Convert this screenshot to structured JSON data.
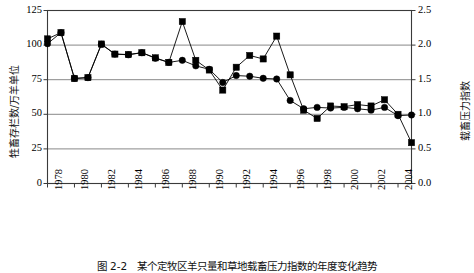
{
  "figure": {
    "caption": "图 2-2　某个定牧区羊只量和草地载畜压力指数的年度变化趋势"
  },
  "chart_data": {
    "type": "line",
    "title": "",
    "xlabel": "",
    "ylabel": "牲畜存栏数/万羊单位",
    "y2label": "载畜压力指数",
    "grid": true,
    "legend": "none",
    "xlim": [
      1978,
      2005
    ],
    "ylim": [
      0,
      125
    ],
    "y2lim": [
      0.0,
      2.5
    ],
    "ytick_labels": [
      "125",
      "100",
      "75",
      "50",
      "25",
      "0"
    ],
    "ytick_values": [
      125,
      100,
      75,
      50,
      25,
      0
    ],
    "y2tick_labels": [
      "2.5",
      "2.0",
      "1.5",
      "1.0",
      "0.5",
      "0.0"
    ],
    "y2tick_values": [
      2.5,
      2.0,
      1.5,
      1.0,
      0.5,
      0.0
    ],
    "xtick_labels": [
      "1978",
      "1980",
      "1982",
      "1984",
      "1986",
      "1988",
      "1990",
      "1992",
      "1994",
      "1996",
      "1998",
      "2000",
      "2002",
      "2004"
    ],
    "xtick_values": [
      1978,
      1980,
      1982,
      1984,
      1986,
      1988,
      1990,
      1992,
      1994,
      1996,
      1998,
      2000,
      2002,
      2004
    ],
    "x": [
      1978,
      1979,
      1980,
      1981,
      1982,
      1983,
      1984,
      1985,
      1986,
      1987,
      1988,
      1989,
      1990,
      1991,
      1992,
      1993,
      1994,
      1995,
      1996,
      1997,
      1998,
      1999,
      2000,
      2001,
      2002,
      2003,
      2004,
      2005
    ],
    "series": [
      {
        "name": "牲畜存栏数/万羊单位",
        "axis": "left",
        "marker": "circle",
        "color": "#000000",
        "values": [
          104.5,
          109.0,
          75.8,
          76.5,
          100.8,
          93.5,
          93.2,
          94.5,
          90.8,
          87.5,
          117.0,
          89.0,
          82.0,
          67.5,
          84.0,
          92.5,
          90.0,
          106.5,
          78.5,
          53.0,
          47.0,
          56.0,
          55.5,
          57.0,
          56.0,
          60.5,
          50.0,
          29.5
        ]
      },
      {
        "name": "载畜压力指数",
        "axis": "right",
        "marker": "circle-small",
        "color": "#000000",
        "values": [
          2.02,
          2.18,
          1.52,
          1.53,
          2.01,
          1.87,
          1.86,
          1.89,
          1.81,
          1.75,
          1.78,
          1.7,
          1.65,
          1.46,
          1.56,
          1.55,
          1.52,
          1.51,
          1.2,
          1.08,
          1.1,
          1.09,
          1.1,
          1.08,
          1.06,
          1.1,
          0.98,
          0.99
        ]
      }
    ]
  }
}
